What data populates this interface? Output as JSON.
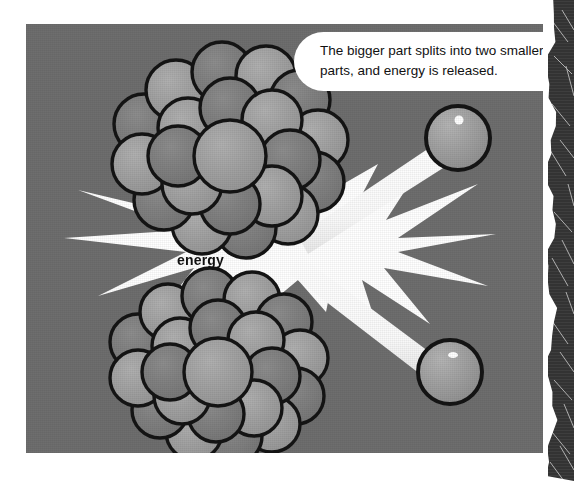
{
  "scene": {
    "title": "Nuclear fission illustration",
    "panel_color": "#6e6e6e",
    "burst_color": "#ffffff",
    "outline_color": "#111111",
    "nucleus_light": "#9a9a9a",
    "nucleus_mid": "#7d7d7d",
    "particle_color": "#a0a0a0",
    "strip_color": "#3a3a3a"
  },
  "caption": {
    "line1": "The bigger part splits into two smaller",
    "line2": "parts, and energy is released."
  },
  "labels": {
    "energy": "energy"
  },
  "elements": {
    "nucleus_top": "nucleus-cluster-top",
    "nucleus_bottom": "nucleus-cluster-bottom",
    "particle_top": "fragment-particle-top",
    "particle_bottom": "fragment-particle-bottom",
    "beam_top": "emission-beam-top",
    "beam_bottom": "emission-beam-bottom",
    "burst": "energy-burst"
  }
}
